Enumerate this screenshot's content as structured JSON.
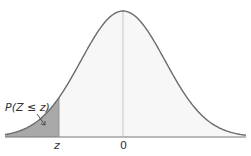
{
  "chart_data": {
    "type": "area",
    "title": "",
    "xlabel": "",
    "ylabel": "",
    "x_ticks": [
      "z",
      "0"
    ],
    "curve": "standard normal density",
    "shaded_region": {
      "from": "-inf",
      "to": "z",
      "label": "P(Z ≤ z)"
    },
    "z_value_approx": -1.5,
    "center_line_at": 0,
    "grid": false,
    "legend": null
  },
  "labels": {
    "probability": "P(Z ≤ z)",
    "z_tick": "z",
    "zero_tick": "0"
  },
  "colors": {
    "curve": "#6b6b6b",
    "shade": "#a9a9a9",
    "fill_light": "#f7f7f7",
    "axis": "#777777"
  }
}
